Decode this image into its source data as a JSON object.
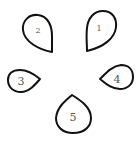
{
  "diagram": {
    "stroke_color": "#111111",
    "label_color": "#555555",
    "background": "#ffffff",
    "petals": [
      {
        "id": 1,
        "label": "1",
        "tip_direction": "down-left"
      },
      {
        "id": 2,
        "label": "2",
        "tip_direction": "down-right"
      },
      {
        "id": 3,
        "label": "3",
        "tip_direction": "right"
      },
      {
        "id": 4,
        "label": "4",
        "tip_direction": "left"
      },
      {
        "id": 5,
        "label": "5",
        "tip_direction": "up"
      }
    ]
  }
}
